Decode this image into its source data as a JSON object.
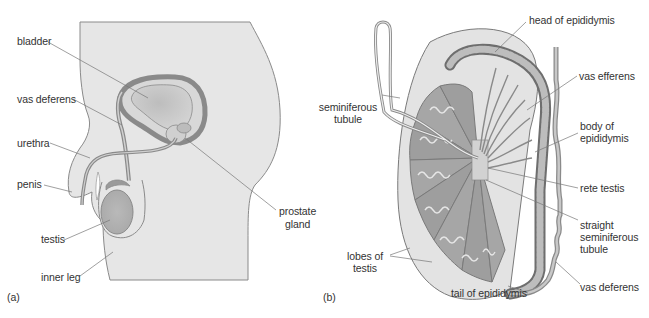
{
  "figure": {
    "panel_a": {
      "tag": "(a)",
      "labels": {
        "bladder": "bladder",
        "vas_deferens": "vas deferens",
        "urethra": "urethra",
        "penis": "penis",
        "testis": "testis",
        "inner_leg": "inner leg",
        "prostate_gland_1": "prostate",
        "prostate_gland_2": "gland"
      }
    },
    "panel_b": {
      "tag": "(b)",
      "labels": {
        "head_of_epididymis": "head of epididymis",
        "seminiferous_tubule_1": "seminiferous",
        "seminiferous_tubule_2": "tubule",
        "vas_efferens": "vas efferens",
        "body_of_epididymis_1": "body of",
        "body_of_epididymis_2": "epididymis",
        "rete_testis": "rete testis",
        "straight_seminiferous_tubule_1": "straight",
        "straight_seminiferous_tubule_2": "seminiferous",
        "straight_seminiferous_tubule_3": "tubule",
        "lobes_of_testis_1": "lobes of",
        "lobes_of_testis_2": "testis",
        "vas_deferens": "vas deferens",
        "tail_of_epididymis": "tail of epididymis"
      }
    },
    "colors": {
      "body_fill": "#e6e6e6",
      "outline": "#7a7a7a",
      "organ_dark": "#9a9a9a",
      "organ_mid": "#b8b8b8",
      "leader_line": "#666666",
      "text": "#333333"
    }
  }
}
